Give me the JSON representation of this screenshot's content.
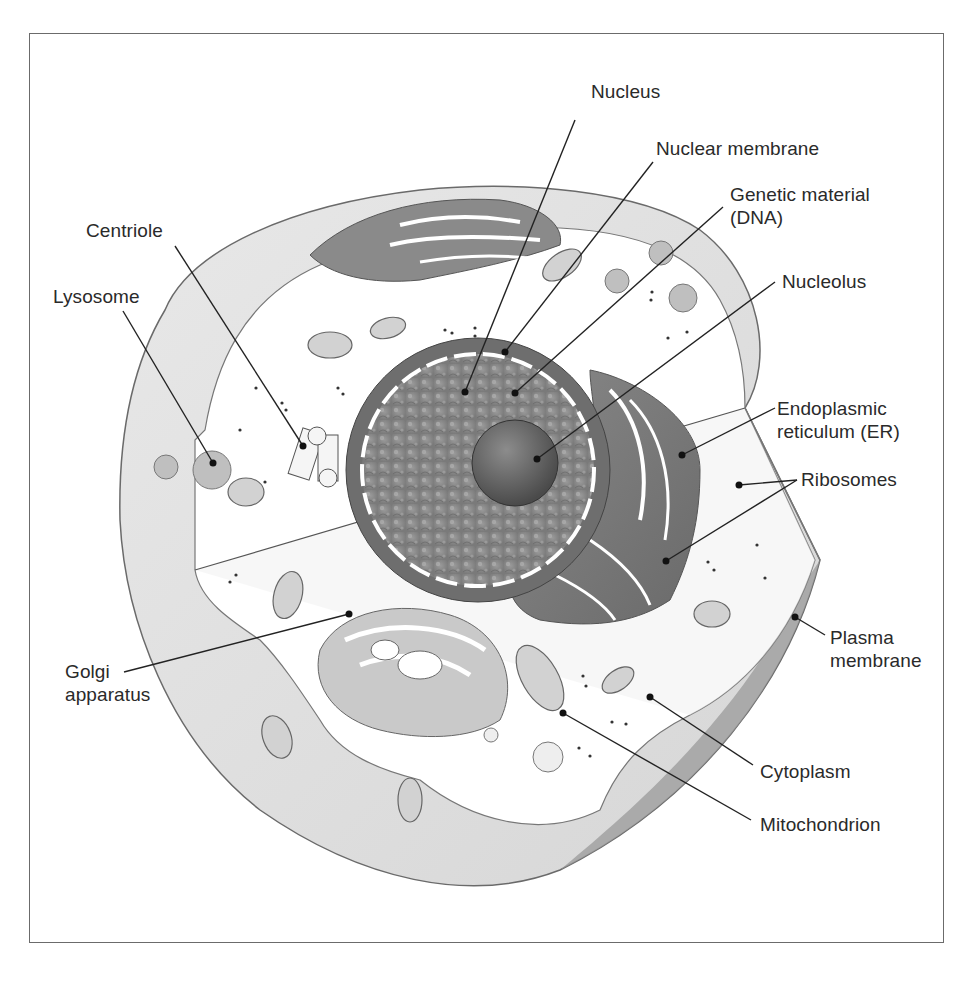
{
  "diagram": {
    "colors": {
      "frame": "#6b6b6b",
      "outer_cell": "#e2e2e2",
      "cut_face": "#f4f4f4",
      "interior": "#ffffff",
      "nucleus_envelope": "#6e6e6e",
      "nucleoplasm": "#8a8a8a",
      "nucleolus": "#5a5a5a",
      "er": "#7a7a7a",
      "golgi": "#c8c8c8",
      "mitochondrion": "#d0d0d0",
      "leader_line": "#222222",
      "label_text": "#2a2a2a"
    },
    "labels": [
      {
        "id": "nucleus",
        "text": "Nucleus",
        "x": 591,
        "y": 90,
        "anchor": [
          575,
          120
        ],
        "target": [
          465,
          392
        ]
      },
      {
        "id": "nuclear-membrane",
        "text": "Nuclear membrane",
        "x": 656,
        "y": 137,
        "anchor": [
          653,
          162
        ],
        "target": [
          505,
          352
        ]
      },
      {
        "id": "genetic-material",
        "text": "Genetic material\n(DNA)",
        "x": 730,
        "y": 183,
        "anchor": [
          723,
          207
        ],
        "target": [
          515,
          393
        ]
      },
      {
        "id": "nucleolus",
        "text": "Nucleolus",
        "x": 782,
        "y": 272,
        "anchor": [
          775,
          282
        ],
        "target": [
          537,
          459
        ]
      },
      {
        "id": "endoplasmic-reticulum",
        "text": "Endoplasmic\nreticulum (ER)",
        "x": 777,
        "y": 397,
        "anchor": [
          775,
          408
        ],
        "target": [
          682,
          455
        ]
      },
      {
        "id": "ribosomes",
        "text": "Ribosomes",
        "x": 801,
        "y": 468,
        "anchor": [
          797,
          480
        ],
        "targets": [
          [
            739,
            485
          ],
          [
            666,
            561
          ]
        ]
      },
      {
        "id": "plasma-membrane",
        "text": "Plasma\nmembrane",
        "x": 830,
        "y": 626,
        "anchor": [
          825,
          635
        ],
        "target": [
          795,
          617
        ]
      },
      {
        "id": "cytoplasm",
        "text": "Cytoplasm",
        "x": 760,
        "y": 760,
        "anchor": [
          753,
          765
        ],
        "target": [
          650,
          697
        ]
      },
      {
        "id": "mitochondrion",
        "text": "Mitochondrion",
        "x": 760,
        "y": 813,
        "anchor": [
          751,
          820
        ],
        "target": [
          563,
          713
        ]
      },
      {
        "id": "centriole",
        "text": "Centriole",
        "x": 86,
        "y": 219,
        "anchor": [
          175,
          246
        ],
        "target": [
          303,
          446
        ]
      },
      {
        "id": "lysosome",
        "text": "Lysosome",
        "x": 53,
        "y": 285,
        "anchor": [
          123,
          311
        ],
        "target": [
          213,
          463
        ]
      },
      {
        "id": "golgi-apparatus",
        "text": "Golgi\napparatus",
        "x": 65,
        "y": 660,
        "anchor": [
          124,
          672
        ],
        "target": [
          349,
          614
        ]
      }
    ]
  }
}
